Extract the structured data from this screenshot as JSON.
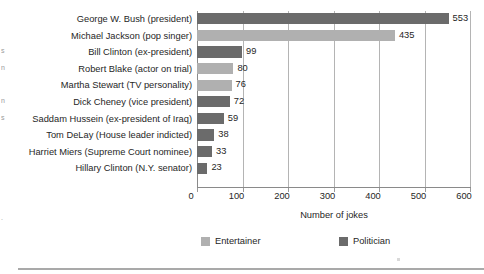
{
  "chart_data": {
    "type": "bar",
    "orientation": "horizontal",
    "title": "",
    "xlabel": "Number of jokes",
    "ylabel": "",
    "xlim": [
      0,
      600
    ],
    "xticks": [
      0,
      100,
      200,
      300,
      400,
      500,
      600
    ],
    "grid": true,
    "legend_position": "bottom",
    "categories": [
      "George W. Bush (president)",
      "Michael Jackson (pop singer)",
      "Bill Clinton (ex-president)",
      "Robert Blake (actor on trial)",
      "Martha Stewart (TV personality)",
      "Dick Cheney (vice president)",
      "Saddam Hussein (ex-president of Iraq)",
      "Tom DeLay (House leader indicted)",
      "Harriet Miers (Supreme Court nominee)",
      "Hillary Clinton (N.Y. senator)"
    ],
    "values": [
      553,
      435,
      99,
      80,
      76,
      72,
      59,
      38,
      33,
      23
    ],
    "groups": [
      "Politician",
      "Entertainer",
      "Politician",
      "Entertainer",
      "Entertainer",
      "Politician",
      "Politician",
      "Politician",
      "Politician",
      "Politician"
    ],
    "legend": [
      {
        "label": "Entertainer",
        "color": "#b0b0b0"
      },
      {
        "label": "Politician",
        "color": "#6b6b6b"
      }
    ],
    "colors": {
      "entertainer": "#b0b0b0",
      "politician": "#6b6b6b",
      "gridline": "#b4b4b4",
      "axis": "#8a8a8a",
      "text": "#262626",
      "background": "#ffffff"
    }
  },
  "edge_fragments": [
    {
      "text": "s",
      "top": 47
    },
    {
      "text": "n",
      "top": 64
    },
    {
      "text": "n",
      "top": 97
    },
    {
      "text": "s",
      "top": 114
    },
    {
      "text": ".",
      "top": 214
    }
  ]
}
